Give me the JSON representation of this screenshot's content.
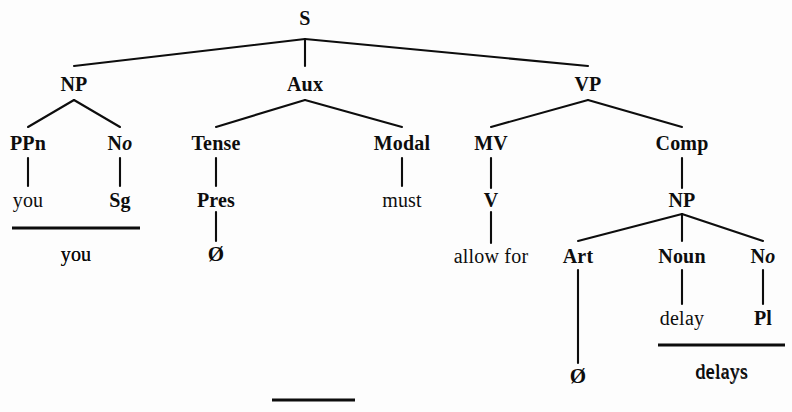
{
  "figure": {
    "kind": "phrase-structure-tree",
    "sentence": "you must allow for delays",
    "ink_color": "#0d0d0d",
    "background_color": "#fdfdfd",
    "width": 792,
    "height": 412
  },
  "nodes": [
    {
      "id": "s",
      "label": "S",
      "kind": "category",
      "x": 305,
      "y": 18
    },
    {
      "id": "np1",
      "label": "NP",
      "kind": "category",
      "x": 74,
      "y": 84
    },
    {
      "id": "aux",
      "label": "Aux",
      "kind": "category",
      "x": 305,
      "y": 84
    },
    {
      "id": "vp",
      "label": "VP",
      "kind": "category",
      "x": 588,
      "y": 84
    },
    {
      "id": "ppn",
      "label": "PPn",
      "kind": "category",
      "x": 28,
      "y": 143
    },
    {
      "id": "no1",
      "label": "No",
      "kind": "category",
      "x": 120,
      "y": 143,
      "italic_tail": true
    },
    {
      "id": "tense",
      "label": "Tense",
      "kind": "category",
      "x": 216,
      "y": 143
    },
    {
      "id": "modal",
      "label": "Modal",
      "kind": "category",
      "x": 402,
      "y": 143
    },
    {
      "id": "mv",
      "label": "MV",
      "kind": "category",
      "x": 491,
      "y": 143
    },
    {
      "id": "comp",
      "label": "Comp",
      "kind": "category",
      "x": 682,
      "y": 143
    },
    {
      "id": "you",
      "label": "you",
      "kind": "terminal",
      "x": 28,
      "y": 200
    },
    {
      "id": "sg",
      "label": "Sg",
      "kind": "terminal-bold",
      "x": 120,
      "y": 200
    },
    {
      "id": "pres",
      "label": "Pres",
      "kind": "terminal-bold",
      "x": 216,
      "y": 200
    },
    {
      "id": "must",
      "label": "must",
      "kind": "terminal",
      "x": 402,
      "y": 200
    },
    {
      "id": "v",
      "label": "V",
      "kind": "category",
      "x": 491,
      "y": 200
    },
    {
      "id": "np2",
      "label": "NP",
      "kind": "category",
      "x": 682,
      "y": 200
    },
    {
      "id": "you_out",
      "label": "you",
      "kind": "terminal",
      "x": 76,
      "y": 254
    },
    {
      "id": "null1",
      "label": "Ø",
      "kind": "null",
      "x": 216,
      "y": 254
    },
    {
      "id": "allowfor",
      "label": "allow for",
      "kind": "terminal",
      "x": 491,
      "y": 256
    },
    {
      "id": "art",
      "label": "Art",
      "kind": "category",
      "x": 578,
      "y": 256
    },
    {
      "id": "noun",
      "label": "Noun",
      "kind": "category",
      "x": 682,
      "y": 256
    },
    {
      "id": "no2",
      "label": "No",
      "kind": "category",
      "x": 763,
      "y": 256,
      "italic_tail": true
    },
    {
      "id": "delay",
      "label": "delay",
      "kind": "terminal",
      "x": 682,
      "y": 318
    },
    {
      "id": "pl",
      "label": "Pl",
      "kind": "terminal-bold",
      "x": 763,
      "y": 318
    },
    {
      "id": "null2",
      "label": "Ø",
      "kind": "null",
      "x": 578,
      "y": 376
    },
    {
      "id": "delays_out",
      "label": "delays",
      "kind": "terminal",
      "x": 722,
      "y": 372
    }
  ],
  "branches": [
    {
      "from": "s",
      "to": "np1",
      "x1": 305,
      "y1": 39,
      "x2": 74,
      "y2": 66
    },
    {
      "from": "s",
      "to": "aux",
      "x1": 305,
      "y1": 39,
      "x2": 305,
      "y2": 66
    },
    {
      "from": "s",
      "to": "vp",
      "x1": 305,
      "y1": 39,
      "x2": 588,
      "y2": 66
    },
    {
      "from": "np1",
      "to": "ppn",
      "x1": 74,
      "y1": 100,
      "x2": 28,
      "y2": 127
    },
    {
      "from": "np1",
      "to": "no1",
      "x1": 74,
      "y1": 100,
      "x2": 120,
      "y2": 127
    },
    {
      "from": "aux",
      "to": "tense",
      "x1": 305,
      "y1": 100,
      "x2": 216,
      "y2": 127
    },
    {
      "from": "aux",
      "to": "modal",
      "x1": 305,
      "y1": 100,
      "x2": 402,
      "y2": 127
    },
    {
      "from": "vp",
      "to": "mv",
      "x1": 588,
      "y1": 100,
      "x2": 491,
      "y2": 127
    },
    {
      "from": "vp",
      "to": "comp",
      "x1": 588,
      "y1": 100,
      "x2": 682,
      "y2": 127
    },
    {
      "from": "ppn",
      "to": "you",
      "x1": 28,
      "y1": 158,
      "x2": 28,
      "y2": 186
    },
    {
      "from": "no1",
      "to": "sg",
      "x1": 120,
      "y1": 158,
      "x2": 120,
      "y2": 186
    },
    {
      "from": "tense",
      "to": "pres",
      "x1": 216,
      "y1": 158,
      "x2": 216,
      "y2": 186
    },
    {
      "from": "modal",
      "to": "must",
      "x1": 402,
      "y1": 158,
      "x2": 402,
      "y2": 186
    },
    {
      "from": "mv",
      "to": "v",
      "x1": 491,
      "y1": 158,
      "x2": 491,
      "y2": 188
    },
    {
      "from": "comp",
      "to": "np2",
      "x1": 682,
      "y1": 158,
      "x2": 682,
      "y2": 188
    },
    {
      "from": "pres",
      "to": "null1",
      "x1": 216,
      "y1": 212,
      "x2": 216,
      "y2": 241
    },
    {
      "from": "v",
      "to": "allowfor",
      "x1": 491,
      "y1": 212,
      "x2": 491,
      "y2": 243
    },
    {
      "from": "np2",
      "to": "art",
      "x1": 682,
      "y1": 214,
      "x2": 578,
      "y2": 241
    },
    {
      "from": "np2",
      "to": "noun",
      "x1": 682,
      "y1": 214,
      "x2": 682,
      "y2": 241
    },
    {
      "from": "np2",
      "to": "no2",
      "x1": 682,
      "y1": 214,
      "x2": 763,
      "y2": 241
    },
    {
      "from": "noun",
      "to": "delay",
      "x1": 682,
      "y1": 270,
      "x2": 682,
      "y2": 304
    },
    {
      "from": "no2",
      "to": "pl",
      "x1": 763,
      "y1": 270,
      "x2": 763,
      "y2": 304
    },
    {
      "from": "art",
      "to": "null2",
      "x1": 578,
      "y1": 270,
      "x2": 578,
      "y2": 363
    }
  ],
  "morph_bars": [
    {
      "id": "bar-you",
      "x1": 12,
      "x2": 140,
      "y": 228,
      "result": "you"
    },
    {
      "id": "bar-delays",
      "x1": 658,
      "x2": 785,
      "y": 345,
      "result": "delays"
    },
    {
      "id": "bar-bottom",
      "x1": 272,
      "x2": 355,
      "y": 400,
      "result": ""
    }
  ]
}
